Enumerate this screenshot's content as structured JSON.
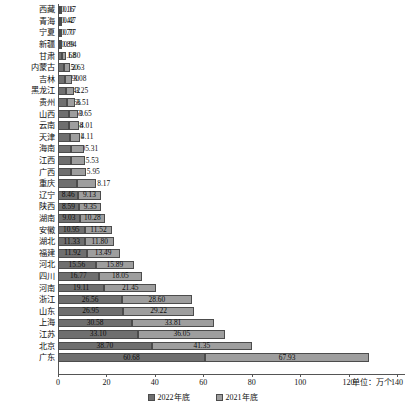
{
  "chart_data": {
    "type": "bar",
    "orientation": "horizontal",
    "stacked": true,
    "title": "",
    "xlabel": "",
    "ylabel": "",
    "unit_note": "单位：万个",
    "xlim": [
      0,
      140
    ],
    "xticks": [
      0,
      20,
      40,
      60,
      80,
      100,
      120,
      140
    ],
    "xtick_labels": [
      "0",
      "20",
      "40",
      "60",
      "80",
      "100",
      "120",
      "140"
    ],
    "grid": false,
    "legend_position": "bottom-center",
    "categories": [
      "西藏",
      "青海",
      "宁夏",
      "新疆",
      "甘肃",
      "内蒙古",
      "吉林",
      "黑龙江",
      "贵州",
      "山西",
      "云南",
      "天津",
      "海南",
      "江西",
      "广西",
      "重庆",
      "辽宁",
      "陕西",
      "湖南",
      "安徽",
      "湖北",
      "福建",
      "河北",
      "四川",
      "河南",
      "浙江",
      "山东",
      "上海",
      "江苏",
      "北京",
      "广东"
    ],
    "series": [
      {
        "name": "2022年底",
        "color": "#6f6f6f",
        "values": [
          0.16,
          0.42,
          0.7,
          0.89,
          1.68,
          2.5,
          2.9,
          3.42,
          3.66,
          4.5,
          4.68,
          4.91,
          5.5,
          5.53,
          5.56,
          7.66,
          8.46,
          8.59,
          9.03,
          10.95,
          11.33,
          11.92,
          15.56,
          16.77,
          19.11,
          26.56,
          26.95,
          30.58,
          33.1,
          38.7,
          60.68
        ]
      },
      {
        "name": "2021年底",
        "color": "#9e9e9e",
        "values": [
          0.17,
          0.47,
          0.77,
          0.94,
          1.8,
          2.63,
          3.08,
          3.25,
          3.51,
          3.65,
          4.01,
          4.11,
          5.31,
          5.53,
          5.95,
          8.17,
          9.13,
          9.35,
          10.28,
          11.52,
          11.8,
          13.49,
          15.89,
          18.05,
          21.45,
          28.6,
          29.22,
          33.81,
          36.05,
          41.35,
          67.93
        ]
      }
    ],
    "value_labels": {
      "2022年底": [
        "0.16",
        "0.42",
        "0.70",
        "0.89",
        "1.68",
        "2.50",
        "2.90",
        "3.42",
        "3.66",
        "4.50",
        "4.68",
        "4.91",
        "5.50",
        "5.53",
        "5.56",
        "7.66",
        "8.46",
        "8.59",
        "9.03",
        "10.95",
        "11.33",
        "11.92",
        "15.56",
        "16.77",
        "19.11",
        "26.56",
        "26.95",
        "30.58",
        "33.10",
        "38.70",
        "60.68"
      ],
      "2021年底": [
        "0.17",
        "0.47",
        "0.77",
        "0.94",
        "1.80",
        "2.63",
        "3.08",
        "3.25",
        "3.51",
        "3.65",
        "4.01",
        "4.11",
        "5.31",
        "5.53",
        "5.95",
        "8.17",
        "9.13",
        "9.35",
        "10.28",
        "11.52",
        "11.80",
        "13.49",
        "15.89",
        "18.05",
        "21.45",
        "28.60",
        "29.22",
        "33.81",
        "36.05",
        "41.35",
        "67.93"
      ]
    }
  },
  "legend": {
    "items": [
      {
        "label": "2022年底",
        "color": "#6f6f6f"
      },
      {
        "label": "2021年底",
        "color": "#9e9e9e"
      }
    ]
  },
  "axis": {
    "unit_note": "单位：万个"
  }
}
